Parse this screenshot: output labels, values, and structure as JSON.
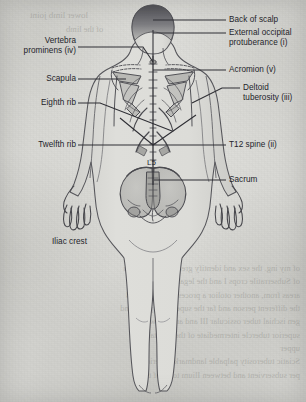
{
  "figure": {
    "view": "posterior",
    "ink_color": "#3a3a40",
    "paper_color": "#dcdcd8"
  },
  "labels": {
    "back_of_scalp": "Back of scalp",
    "external_occipital_protuberance": "External occipital\nprotuberance (i)",
    "acromion": "Acromion (v)",
    "deltoid_tuberosity": "Deltoid\ntuberosity (iii)",
    "t12_spine": "T12 spine (ii)",
    "sacrum": "Sacrum",
    "vertebra_prominens": "Vertebra\nprominens (iv)",
    "scapula": "Scapula",
    "eighth_rib": "Eighth rib",
    "twelfth_rib": "Twelfth rib",
    "iliac_crest": "Iliac crest",
    "l5": "L5"
  },
  "bleed_through": {
    "top_fragments": [
      "lower limb joint",
      "of the limb"
    ],
    "body_lines": [
      "of my ing. the sex and identify greater sciatic notch",
      "of Subserratile crops  I and the legal suggestion  In",
      "areas from, another otolior  a processor  the  1 14-24",
      "the different  person  and  far  the superficial plane  and",
      "  gen  ischial tuber  ossicular  III and  area  between",
      "superior  tubercle  intermediate  of  the  sagittal",
      "upper",
      "Sciatic  tuberosity  palpable  landmarks  inferior  of",
      "per  subservient  and  between  Ilium  tools  of  the"
    ]
  }
}
